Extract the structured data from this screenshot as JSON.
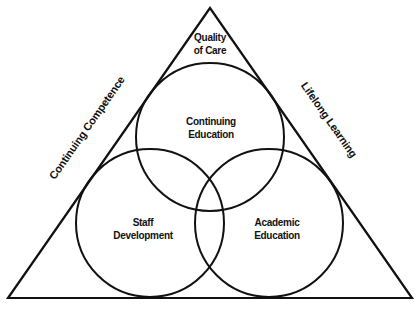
{
  "diagram": {
    "type": "triangle-venn",
    "colors": {
      "stroke": "#111111",
      "background": "#ffffff",
      "text": "#111111"
    },
    "triangle": {
      "apex_label": [
        "Quality",
        "of Care"
      ],
      "left_side_label": "Continuing Competence",
      "right_side_label": "Lifelong Learning"
    },
    "circles": [
      {
        "id": "top",
        "label": [
          "Continuing",
          "Education"
        ]
      },
      {
        "id": "left",
        "label": [
          "Staff",
          "Development"
        ]
      },
      {
        "id": "right",
        "label": [
          "Academic",
          "Education"
        ]
      }
    ]
  }
}
